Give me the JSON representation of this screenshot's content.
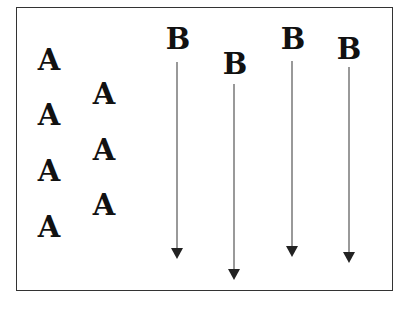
{
  "diagram": {
    "frame": {
      "border_color": "#333333",
      "background": "#ffffff"
    },
    "group_a": {
      "label": "A",
      "items": [
        {
          "label": "A",
          "x": 34,
          "y": 46
        },
        {
          "label": "A",
          "x": 34,
          "y": 101
        },
        {
          "label": "A",
          "x": 34,
          "y": 157
        },
        {
          "label": "A",
          "x": 34,
          "y": 213
        },
        {
          "label": "A",
          "x": 89,
          "y": 80
        },
        {
          "label": "A",
          "x": 89,
          "y": 136
        },
        {
          "label": "A",
          "x": 89,
          "y": 191
        }
      ]
    },
    "group_b": {
      "label": "B",
      "items": [
        {
          "label": "B",
          "x": 163,
          "y": 25,
          "line_x": 177,
          "line_start": 62,
          "tip_y": 259
        },
        {
          "label": "B",
          "x": 220,
          "y": 50,
          "line_x": 234,
          "line_start": 84,
          "tip_y": 280
        },
        {
          "label": "B",
          "x": 278,
          "y": 25,
          "line_x": 292,
          "line_start": 61,
          "tip_y": 257
        },
        {
          "label": "B",
          "x": 334,
          "y": 35,
          "line_x": 349,
          "line_start": 67,
          "tip_y": 263
        }
      ],
      "arrow_color": "#222222",
      "line_color": "#555555"
    }
  }
}
